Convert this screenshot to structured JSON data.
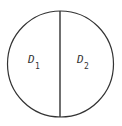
{
  "diagram": {
    "shape": "circle divided by vertical diameter",
    "regions": [
      {
        "label": "D",
        "subscript": "1",
        "side": "left"
      },
      {
        "label": "D",
        "subscript": "2",
        "side": "right"
      }
    ],
    "stroke_color": "#333333",
    "background": "#ffffff"
  }
}
